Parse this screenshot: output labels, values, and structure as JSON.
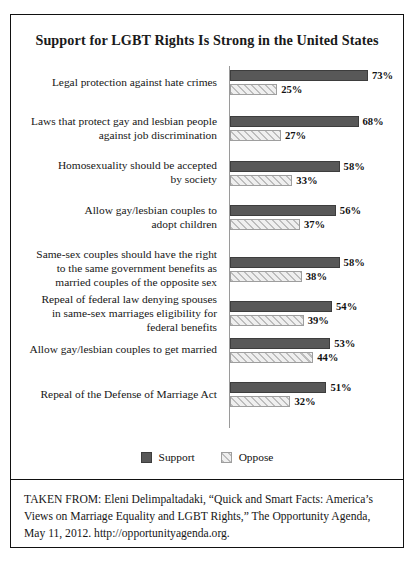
{
  "figure": {
    "title": "Support for LGBT Rights Is Strong in the United States",
    "citation": "TAKEN FROM: Eleni Delimpaltadaki, “Quick and Smart Facts: America’s Views on Marriage Equality and LGBT Rights,” The Opportunity Agenda, May 11, 2012. http://opportunityagenda.org."
  },
  "legend": {
    "support_label": "Support",
    "oppose_label": "Oppose"
  },
  "colors": {
    "support_bar": "#585858",
    "oppose_bar": "#e2e2e2",
    "oppose_hatch": "#bdbdbd",
    "axis_line": "#9a9a9a",
    "border": "#111111",
    "background": "#ffffff"
  },
  "chart_data": {
    "type": "bar",
    "orientation": "horizontal",
    "title": "Support for LGBT Rights Is Strong in the United States",
    "xlabel": "",
    "ylabel": "",
    "xlim": [
      0,
      80
    ],
    "grid": false,
    "legend_position": "bottom-center",
    "value_suffix": "%",
    "categories": [
      "Legal protection against hate crimes",
      "Laws that protect gay and lesbian people against job discrimination",
      "Homosexuality should be accepted by society",
      "Allow gay/lesbian couples to adopt children",
      "Same-sex couples should have the right to the same government benefits as married couples of the opposite sex",
      "Repeal of federal law denying spouses in same-sex marriages eligibility for federal benefits",
      "Allow gay/lesbian couples to get married",
      "Repeal of the Defense of Marriage Act"
    ],
    "series": [
      {
        "name": "Support",
        "values": [
          73,
          68,
          58,
          56,
          58,
          54,
          53,
          51
        ]
      },
      {
        "name": "Oppose",
        "values": [
          25,
          27,
          33,
          37,
          38,
          39,
          44,
          32
        ]
      }
    ]
  },
  "rows": [
    {
      "label_lines": [
        "Legal protection against hate crimes"
      ],
      "support": 73,
      "oppose": 25,
      "support_label": "73%",
      "oppose_label": "25%"
    },
    {
      "label_lines": [
        "Laws that protect gay and lesbian people",
        "against job discrimination"
      ],
      "support": 68,
      "oppose": 27,
      "support_label": "68%",
      "oppose_label": "27%"
    },
    {
      "label_lines": [
        "Homosexuality should be accepted",
        "by society"
      ],
      "support": 58,
      "oppose": 33,
      "support_label": "58%",
      "oppose_label": "33%"
    },
    {
      "label_lines": [
        "Allow gay/lesbian couples to",
        "adopt children"
      ],
      "support": 56,
      "oppose": 37,
      "support_label": "56%",
      "oppose_label": "37%"
    },
    {
      "label_lines": [
        "Same-sex couples should have the right",
        "to the same government benefits as",
        "married couples of the opposite sex"
      ],
      "support": 58,
      "oppose": 38,
      "support_label": "58%",
      "oppose_label": "38%"
    },
    {
      "label_lines": [
        "Repeal of federal law denying spouses",
        "in same-sex marriages eligibility for",
        "federal benefits"
      ],
      "support": 54,
      "oppose": 39,
      "support_label": "54%",
      "oppose_label": "39%"
    },
    {
      "label_lines": [
        "Allow gay/lesbian couples to get married"
      ],
      "support": 53,
      "oppose": 44,
      "support_label": "53%",
      "oppose_label": "44%"
    },
    {
      "label_lines": [
        "Repeal of the Defense of Marriage Act"
      ],
      "support": 51,
      "oppose": 32,
      "support_label": "51%",
      "oppose_label": "32%"
    }
  ]
}
